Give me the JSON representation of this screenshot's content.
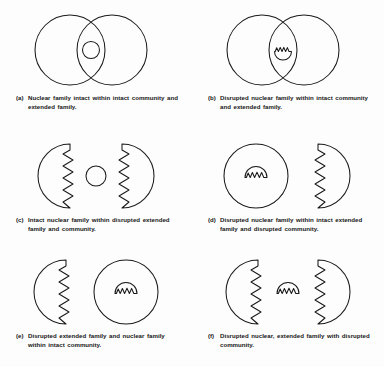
{
  "figure": {
    "stroke_color": "#1a1a1a",
    "background_color": "#fdfdfd",
    "panel_count": 6
  },
  "panels": [
    {
      "id": "a",
      "label": "(a)",
      "caption": "Nuclear family intact within intact community and extended family.",
      "big_circle_left": {
        "edge": "intact",
        "boundary": "smooth"
      },
      "big_circle_right": {
        "edge": "intact",
        "boundary": "smooth"
      },
      "arrangement": "overlapping",
      "small_circle": {
        "present": true,
        "state": "intact",
        "position": "intersection"
      }
    },
    {
      "id": "b",
      "label": "(b)",
      "caption": "Disrupted nuclear family within intact community and extended family.",
      "big_circle_left": {
        "edge": "intact",
        "boundary": "smooth"
      },
      "big_circle_right": {
        "edge": "intact",
        "boundary": "smooth"
      },
      "arrangement": "overlapping",
      "small_circle": {
        "present": true,
        "state": "disrupted",
        "position": "intersection"
      }
    },
    {
      "id": "c",
      "label": "(c)",
      "caption": "Intact nuclear family within disrupted extended family and community.",
      "big_circle_left": {
        "edge": "disrupted",
        "boundary": "zigzag-right"
      },
      "big_circle_right": {
        "edge": "disrupted",
        "boundary": "zigzag-left"
      },
      "arrangement": "separated",
      "small_circle": {
        "present": true,
        "state": "intact",
        "position": "between"
      }
    },
    {
      "id": "d",
      "label": "(d)",
      "caption": "Disrupted nuclear family within intact extended family and disrupted community.",
      "big_circle_left": {
        "edge": "intact",
        "boundary": "smooth"
      },
      "big_circle_right": {
        "edge": "disrupted",
        "boundary": "zigzag-left"
      },
      "arrangement": "separated",
      "small_circle": {
        "present": true,
        "state": "disrupted",
        "position": "inside-left"
      }
    },
    {
      "id": "e",
      "label": "(e)",
      "caption": "Disrupted extended family and nuclear family within intact community.",
      "big_circle_left": {
        "edge": "disrupted",
        "boundary": "zigzag-right"
      },
      "big_circle_right": {
        "edge": "intact",
        "boundary": "smooth"
      },
      "arrangement": "separated",
      "small_circle": {
        "present": true,
        "state": "disrupted",
        "position": "inside-right"
      }
    },
    {
      "id": "f",
      "label": "(f)",
      "caption": "Disrupted nuclear, extended family with disrupted community.",
      "big_circle_left": {
        "edge": "disrupted",
        "boundary": "zigzag-right"
      },
      "big_circle_right": {
        "edge": "disrupted",
        "boundary": "zigzag-left"
      },
      "arrangement": "separated",
      "small_circle": {
        "present": true,
        "state": "disrupted",
        "position": "between"
      }
    }
  ]
}
